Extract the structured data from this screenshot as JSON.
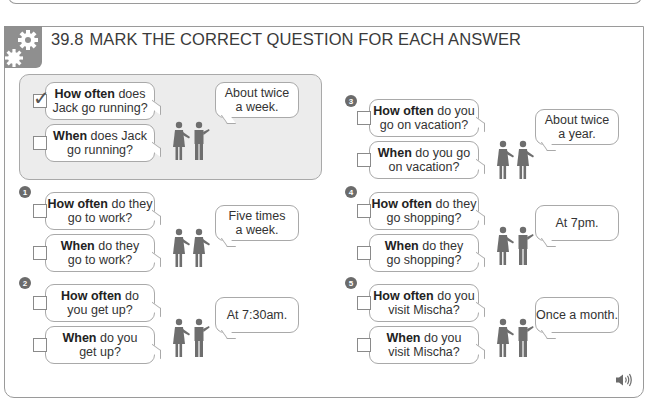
{
  "exercise": {
    "number": "39.8",
    "title": "MARK THE CORRECT QUESTION FOR EACH ANSWER",
    "header_icon": "gears-icon",
    "audio_icon": "speaker-icon"
  },
  "example": {
    "questions": [
      {
        "bold": "How often",
        "rest_line1": " does",
        "line2": "Jack go running?",
        "checked": true
      },
      {
        "bold": "When",
        "rest_line1": " does Jack",
        "line2": "go running?",
        "checked": false
      }
    ],
    "answer_line1": "About twice",
    "answer_line2": "a week."
  },
  "items": [
    {
      "number": "1",
      "questions": [
        {
          "bold": "How often",
          "rest_line1": " do they",
          "line2": "go to work?",
          "checked": false
        },
        {
          "bold": "When",
          "rest_line1": " do they",
          "line2": "go to work?",
          "checked": false
        }
      ],
      "answer_line1": "Five times",
      "answer_line2": "a week."
    },
    {
      "number": "2",
      "questions": [
        {
          "bold": "How often",
          "rest_line1": " do",
          "line2": "you get up?",
          "checked": false
        },
        {
          "bold": "When",
          "rest_line1": " do you",
          "line2": "get up?",
          "checked": false
        }
      ],
      "answer_line1": "At 7:30am.",
      "answer_line2": ""
    },
    {
      "number": "3",
      "questions": [
        {
          "bold": "How often",
          "rest_line1": " do you",
          "line2": "go on vacation?",
          "checked": false
        },
        {
          "bold": "When",
          "rest_line1": " do you go",
          "line2": "on vacation?",
          "checked": false
        }
      ],
      "answer_line1": "About twice",
      "answer_line2": "a year."
    },
    {
      "number": "4",
      "questions": [
        {
          "bold": "How often",
          "rest_line1": " do they",
          "line2": "go shopping?",
          "checked": false
        },
        {
          "bold": "When",
          "rest_line1": " do they",
          "line2": "go shopping?",
          "checked": false
        }
      ],
      "answer_line1": "At 7pm.",
      "answer_line2": ""
    },
    {
      "number": "5",
      "questions": [
        {
          "bold": "How often",
          "rest_line1": " do you",
          "line2": "visit Mischa?",
          "checked": false
        },
        {
          "bold": "When",
          "rest_line1": " do you",
          "line2": "visit Mischa?",
          "checked": false
        }
      ],
      "answer_line1": "Once a month.",
      "answer_line2": ""
    }
  ],
  "colors": {
    "figure": "#6e6e6e",
    "badge": "#6b6b6b",
    "panel": "#ececec",
    "border": "#a9a9a9"
  }
}
